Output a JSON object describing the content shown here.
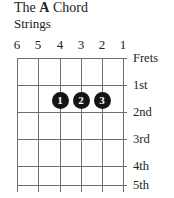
{
  "title": {
    "prefix": "The ",
    "chord_name": "A",
    "suffix": " Chord"
  },
  "strings_label": "Strings",
  "string_numbers": [
    {
      "label": "6",
      "x": 17
    },
    {
      "label": "5",
      "x": 38
    },
    {
      "label": "4",
      "x": 60
    },
    {
      "label": "3",
      "x": 81
    },
    {
      "label": "2",
      "x": 102
    },
    {
      "label": "1",
      "x": 123
    }
  ],
  "fret_labels": [
    {
      "label": "Frets",
      "y": 58
    },
    {
      "label": "1st",
      "y": 85
    },
    {
      "label": "2nd",
      "y": 112
    },
    {
      "label": "3rd",
      "y": 139
    },
    {
      "label": "4th",
      "y": 166
    },
    {
      "label": "5th",
      "y": 185
    }
  ],
  "grid": {
    "left": 17,
    "right": 127,
    "string_left": 17,
    "string_right": 123,
    "top": 58,
    "bottom": 185,
    "string_bottom": 192,
    "fret_ys": [
      58,
      85,
      112,
      139,
      166,
      185
    ],
    "string_xs": [
      17,
      38,
      60,
      81,
      102,
      123
    ],
    "line_color": "#6e6e6e"
  },
  "finger_dots": [
    {
      "finger": "1",
      "string": "4",
      "fret": "2",
      "x": 60,
      "y": 100
    },
    {
      "finger": "2",
      "string": "3",
      "fret": "2",
      "x": 81,
      "y": 100
    },
    {
      "finger": "3",
      "string": "2",
      "fret": "2",
      "x": 102,
      "y": 100
    }
  ],
  "colors": {
    "dot_fill": "#141414",
    "dot_text": "#ffffff",
    "line": "#6e6e6e",
    "text": "#222222",
    "background": "#ffffff"
  }
}
